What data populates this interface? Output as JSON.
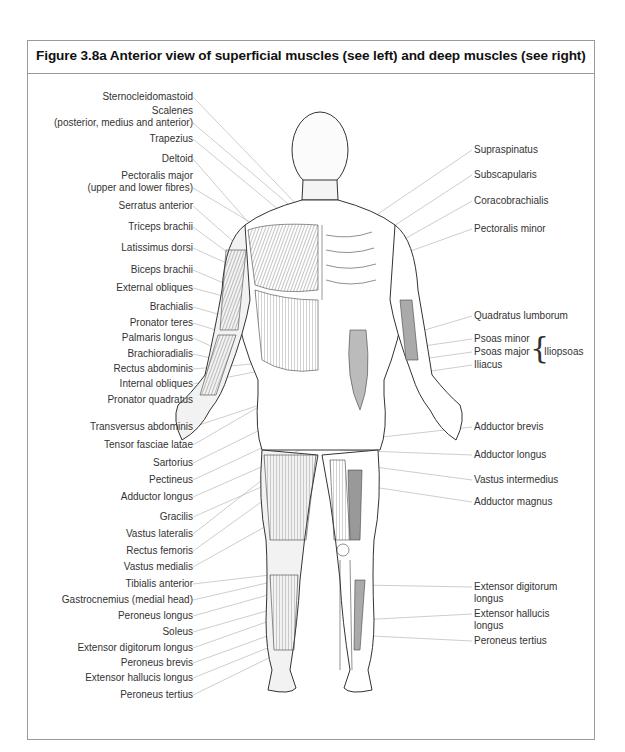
{
  "figure": {
    "title": "Figure 3.8a Anterior view of superficial muscles (see left) and deep muscles (see right)"
  },
  "left_labels": [
    {
      "text": "Sternocleidomastoid",
      "y": 97
    },
    {
      "text": "Scalenes",
      "y": 111
    },
    {
      "text": "(posterior, medius and anterior)",
      "y": 123
    },
    {
      "text": "Trapezius",
      "y": 139
    },
    {
      "text": "Deltoid",
      "y": 159
    },
    {
      "text": "Pectoralis major",
      "y": 176
    },
    {
      "text": "(upper and lower fibres)",
      "y": 188
    },
    {
      "text": "Serratus anterior",
      "y": 206
    },
    {
      "text": "Triceps brachii",
      "y": 227
    },
    {
      "text": "Latissimus dorsi",
      "y": 248
    },
    {
      "text": "Biceps brachii",
      "y": 270
    },
    {
      "text": "External obliques",
      "y": 288
    },
    {
      "text": "Brachialis",
      "y": 307
    },
    {
      "text": "Pronator teres",
      "y": 323
    },
    {
      "text": "Palmaris longus",
      "y": 338
    },
    {
      "text": "Brachioradialis",
      "y": 354
    },
    {
      "text": "Rectus abdominis",
      "y": 369
    },
    {
      "text": "Internal obliques",
      "y": 384
    },
    {
      "text": "Pronator quadratus",
      "y": 400
    },
    {
      "text": "Transversus abdominis",
      "y": 427
    },
    {
      "text": "Tensor fasciae latae",
      "y": 445
    },
    {
      "text": "Sartorius",
      "y": 463
    },
    {
      "text": "Pectineus",
      "y": 480
    },
    {
      "text": "Adductor longus",
      "y": 497
    },
    {
      "text": "Gracilis",
      "y": 517
    },
    {
      "text": "Vastus lateralis",
      "y": 534
    },
    {
      "text": "Rectus femoris",
      "y": 551
    },
    {
      "text": "Vastus medialis",
      "y": 567
    },
    {
      "text": "Tibialis anterior",
      "y": 584
    },
    {
      "text": "Gastrocnemius (medial head)",
      "y": 600
    },
    {
      "text": "Peroneus longus",
      "y": 616
    },
    {
      "text": "Soleus",
      "y": 632
    },
    {
      "text": "Extensor digitorum longus",
      "y": 648
    },
    {
      "text": "Peroneus brevis",
      "y": 663
    },
    {
      "text": "Extensor hallucis longus",
      "y": 678
    },
    {
      "text": "Peroneus tertius",
      "y": 695
    }
  ],
  "right_labels": [
    {
      "text": "Supraspinatus",
      "y": 150
    },
    {
      "text": "Subscapularis",
      "y": 175
    },
    {
      "text": "Coracobrachialis",
      "y": 201
    },
    {
      "text": "Pectoralis minor",
      "y": 229
    },
    {
      "text": "Quadratus lumborum",
      "y": 316
    },
    {
      "text": "Psoas minor",
      "y": 339
    },
    {
      "text": "Psoas major",
      "y": 352
    },
    {
      "text": "Iliacus",
      "y": 365
    },
    {
      "text": "Adductor brevis",
      "y": 427
    },
    {
      "text": "Adductor longus",
      "y": 455
    },
    {
      "text": "Vastus intermedius",
      "y": 480
    },
    {
      "text": "Adductor magnus",
      "y": 502
    },
    {
      "text": "Extensor digitorum",
      "y": 587
    },
    {
      "text": "longus",
      "y": 599
    },
    {
      "text": "Extensor hallucis",
      "y": 614
    },
    {
      "text": "longus",
      "y": 626
    },
    {
      "text": "Peroneus tertius",
      "y": 641
    }
  ],
  "group_label": {
    "text": "Iliopsoas",
    "members": [
      "Psoas minor",
      "Psoas major",
      "Iliacus"
    ]
  },
  "colors": {
    "border": "#9a9a9a",
    "leader_line": "#b5b5b5",
    "text": "#333333",
    "title": "#111111"
  }
}
